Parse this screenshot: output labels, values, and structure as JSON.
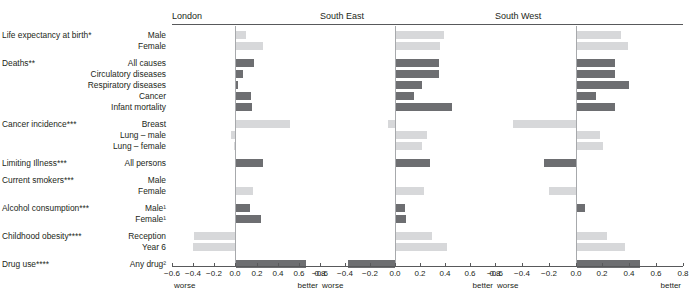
{
  "chart_data": {
    "type": "bar",
    "title": "",
    "orientation": "horizontal",
    "grid": false,
    "legend": null,
    "xlabel": "",
    "ylabel": "",
    "xlim": [
      -0.6,
      0.8
    ],
    "xticks": [
      -0.6,
      -0.4,
      -0.2,
      0.0,
      0.2,
      0.4,
      0.6,
      0.8
    ],
    "xticklabels": [
      "−0.6",
      "−0.4",
      "−0.2",
      "0.0",
      "0.2",
      "0.4",
      "0.6",
      "0.8"
    ],
    "axis_end_labels": {
      "left": "worse",
      "right": "better"
    },
    "series_colors": {
      "dark": "#6d6e71",
      "light": "#d7d8da"
    },
    "panels": [
      "London",
      "South East",
      "South West"
    ],
    "groups": [
      {
        "group": "Life expectancy at birth*",
        "rows": [
          {
            "label": "Male",
            "shade": "light",
            "values": {
              "London": 0.09,
              "South East": 0.38,
              "South West": 0.33
            }
          },
          {
            "label": "Female",
            "shade": "light",
            "values": {
              "London": 0.26,
              "South East": 0.35,
              "South West": 0.38
            }
          }
        ]
      },
      {
        "group": "Deaths**",
        "rows": [
          {
            "label": "All causes",
            "shade": "dark",
            "values": {
              "London": 0.17,
              "South East": 0.34,
              "South West": 0.28
            }
          },
          {
            "label": "Circulatory diseases",
            "shade": "dark",
            "values": {
              "London": 0.07,
              "South East": 0.34,
              "South West": 0.28
            }
          },
          {
            "label": "Respiratory diseases",
            "shade": "dark",
            "values": {
              "London": 0.02,
              "South East": 0.21,
              "South West": 0.39
            }
          },
          {
            "label": "Cancer",
            "shade": "dark",
            "values": {
              "London": 0.14,
              "South East": 0.14,
              "South West": 0.14
            }
          },
          {
            "label": "Infant mortality",
            "shade": "dark",
            "values": {
              "London": 0.15,
              "South East": 0.45,
              "South West": 0.28
            }
          }
        ]
      },
      {
        "group": "Cancer incidence***",
        "rows": [
          {
            "label": "Breast",
            "shade": "light",
            "values": {
              "London": 0.51,
              "South East": -0.06,
              "South West": -0.47
            }
          },
          {
            "label": "Lung – male",
            "shade": "light",
            "values": {
              "London": -0.04,
              "South East": 0.25,
              "South West": 0.17
            }
          },
          {
            "label": "Lung – female",
            "shade": "light",
            "values": {
              "London": -0.01,
              "South East": 0.21,
              "South West": 0.19
            }
          }
        ]
      },
      {
        "group": "Limiting Illness***",
        "rows": [
          {
            "label": "All persons",
            "shade": "dark",
            "values": {
              "London": 0.26,
              "South East": 0.27,
              "South West": -0.24
            }
          }
        ]
      },
      {
        "group": "Current smokers***",
        "rows": [
          {
            "label": "Male",
            "shade": "light",
            "values": {
              "London": 0.0,
              "South East": 0.0,
              "South West": 0.0
            }
          },
          {
            "label": "Female",
            "shade": "light",
            "values": {
              "London": 0.16,
              "South East": 0.22,
              "South West": -0.2
            }
          }
        ]
      },
      {
        "group": "Alcohol consumption***",
        "rows": [
          {
            "label": "Male¹",
            "shade": "dark",
            "values": {
              "London": 0.13,
              "South East": 0.07,
              "South West": 0.06
            }
          },
          {
            "label": "Female¹",
            "shade": "dark",
            "values": {
              "London": 0.24,
              "South East": 0.08,
              "South West": 0.0
            }
          }
        ]
      },
      {
        "group": "Childhood obesity****",
        "rows": [
          {
            "label": "Reception",
            "shade": "light",
            "values": {
              "London": -0.39,
              "South East": 0.29,
              "South West": 0.22
            }
          },
          {
            "label": "Year 6",
            "shade": "light",
            "values": {
              "London": -0.4,
              "South East": 0.41,
              "South West": 0.36
            }
          }
        ]
      },
      {
        "group": "Drug use****",
        "rows": [
          {
            "label": "Any drug²",
            "shade": "dark",
            "values": {
              "London": 0.66,
              "South East": -0.38,
              "South West": 0.47
            }
          }
        ]
      }
    ]
  }
}
